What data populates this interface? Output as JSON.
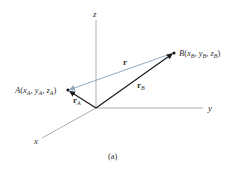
{
  "figure": {
    "caption": "(a)",
    "axes": {
      "x_label": "x",
      "y_label": "y",
      "z_label": "z"
    },
    "points": {
      "A": {
        "name": "A",
        "open": "(",
        "coord1": "x",
        "sub1": "A",
        "coord2": "y",
        "sub2": "A",
        "coord3": "z",
        "sub3": "A",
        "close": ")"
      },
      "B": {
        "name": "B",
        "open": "(",
        "coord1": "x",
        "sub1": "B",
        "coord2": "y",
        "sub2": "B",
        "coord3": "z",
        "sub3": "B",
        "close": ")"
      }
    },
    "vectors": {
      "r": {
        "label": "r"
      },
      "rA": {
        "label": "r",
        "sub": "A"
      },
      "rB": {
        "label": "r",
        "sub": "B"
      }
    },
    "colors": {
      "axis": "#9a9a9a",
      "vector": "#1a1a1a",
      "relative_vector": "#8fa8bf",
      "text": "#333333"
    },
    "separator": ", "
  }
}
